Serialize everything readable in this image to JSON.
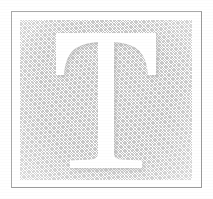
{
  "image": {
    "kind": "scanned-decorative-initial",
    "subject_letter": "T",
    "caption": "",
    "width_px": 213,
    "height_px": 199
  },
  "colors": {
    "page_background": "#ffffff",
    "border_rule": "#a8a8a8",
    "halftone_dark": "#bdbdbd",
    "halftone_light": "#cfcfcf",
    "letter_fill": "#ffffff",
    "letter_shadow": "#b4b4b4",
    "letter_shadow_soft": "#d2d2d2"
  },
  "frame": {
    "rule_label": "border-rule",
    "panel_label": "halftone-panel",
    "rule_thickness_px": 1,
    "panel_screen": "45-degree crosshatch dither"
  },
  "letter": {
    "glyph": "T",
    "style": "serif capital with bracketed serifs",
    "shadow_side": "right-and-inner",
    "shadow_label": "embossed-shadow"
  }
}
